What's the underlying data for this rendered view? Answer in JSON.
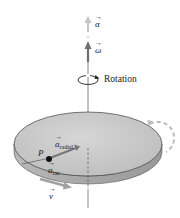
{
  "figure": {
    "type": "physics-diagram",
    "labels": {
      "alpha": "α",
      "omega": "ω",
      "rotation": "Rotation",
      "point": "P",
      "a_radial_symbol": "a",
      "a_radial_sub": "radial",
      "a_tan_symbol": "a",
      "a_tan_sub": "tan",
      "velocity": "v"
    },
    "colors": {
      "disk_top": "#c8c8c8",
      "disk_edge": "#a9a9a9",
      "axis": "#555555",
      "vector_dark": "#6e6e6e",
      "vector_light": "#bdbdbd",
      "point": "#111111"
    }
  }
}
